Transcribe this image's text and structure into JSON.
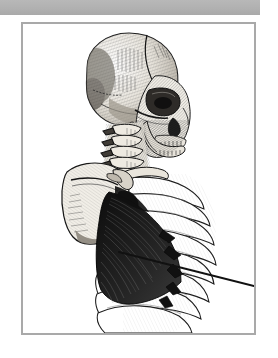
{
  "page": {
    "title": "Anatomical Plate — Skull, Cervical Spine and Thorax",
    "background_color": "#ffffff",
    "width": 278,
    "height": 358
  },
  "top_band": {
    "name": "top-gray-band",
    "color": "#b3b3b3",
    "width": 260,
    "height": 15
  },
  "plate": {
    "frame": {
      "border_color": "#a9a9a9",
      "border_width": 2,
      "background": "#ffffff",
      "x": 21,
      "y": 22,
      "width": 235,
      "height": 313
    },
    "illustration": {
      "type": "anatomical-engraving",
      "style": "hatched line engraving, grayscale",
      "view": "lateral / oblique left profile",
      "subject": "human skull, cervical vertebrae, scapula and rib cage with serratus anterior muscle",
      "ink_color": "#1a1a1a",
      "bone_fill": "#f2efe9",
      "shadow_fill": "#5a5a5a",
      "muscle_fill": "#151515",
      "parts": [
        {
          "id": "cranium",
          "label": "Cranium"
        },
        {
          "id": "frontal-bone",
          "label": "Frontal bone"
        },
        {
          "id": "parietal-bone",
          "label": "Parietal bone"
        },
        {
          "id": "temporal-bone",
          "label": "Temporal bone"
        },
        {
          "id": "orbit",
          "label": "Orbit"
        },
        {
          "id": "nasal-aperture",
          "label": "Nasal aperture"
        },
        {
          "id": "maxilla",
          "label": "Maxilla"
        },
        {
          "id": "mandible",
          "label": "Mandible"
        },
        {
          "id": "teeth",
          "label": "Teeth"
        },
        {
          "id": "cervical-spine",
          "label": "Cervical vertebrae"
        },
        {
          "id": "scapula",
          "label": "Scapula"
        },
        {
          "id": "clavicle",
          "label": "Clavicle"
        },
        {
          "id": "ribs",
          "label": "Ribs"
        },
        {
          "id": "serratus-anterior",
          "label": "Serratus anterior muscle"
        }
      ],
      "pointer": {
        "label": "leader line to serratus anterior",
        "color": "#111111",
        "from": [
          118,
          228
        ],
        "to": [
          233,
          259
        ]
      }
    }
  }
}
